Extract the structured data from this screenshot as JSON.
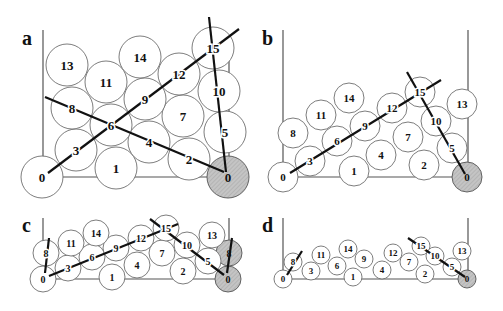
{
  "figure": {
    "hatch_color": "#c4c4c4",
    "panels": [
      {
        "id": "a",
        "label": "a",
        "label_pos": [
          22,
          45
        ],
        "radius": 21,
        "font_size": 13,
        "walls": {
          "left_x": 43,
          "right_x": 229,
          "top_left": 30,
          "top_right": 35,
          "bottom_y": 177
        },
        "balls": [
          {
            "n": "0",
            "x": 42,
            "y": 177
          },
          {
            "n": "1",
            "x": 116,
            "y": 168
          },
          {
            "n": "2",
            "x": 189,
            "y": 159
          },
          {
            "n": "0",
            "x": 228,
            "y": 177,
            "fixed": true
          },
          {
            "n": "3",
            "x": 76,
            "y": 150
          },
          {
            "n": "4",
            "x": 149,
            "y": 142
          },
          {
            "n": "5",
            "x": 225,
            "y": 132
          },
          {
            "n": "6",
            "x": 111,
            "y": 125
          },
          {
            "n": "7",
            "x": 183,
            "y": 116
          },
          {
            "n": "8",
            "x": 72,
            "y": 108
          },
          {
            "n": "9",
            "x": 145,
            "y": 99
          },
          {
            "n": "10",
            "x": 219,
            "y": 91
          },
          {
            "n": "11",
            "x": 106,
            "y": 82
          },
          {
            "n": "12",
            "x": 179,
            "y": 74
          },
          {
            "n": "13",
            "x": 67,
            "y": 65
          },
          {
            "n": "14",
            "x": 140,
            "y": 57
          },
          {
            "n": "15",
            "x": 213,
            "y": 48
          }
        ],
        "chains": [
          [
            [
              48,
              173
            ],
            [
              239,
              29
            ]
          ],
          [
            [
              45,
              97
            ],
            [
              224,
              172
            ]
          ],
          [
            [
              209,
              17
            ],
            [
              226,
              172
            ]
          ]
        ]
      },
      {
        "id": "b",
        "label": "b",
        "label_pos": [
          262,
          45
        ],
        "radius": 15,
        "font_size": 11,
        "walls": {
          "left_x": 283,
          "right_x": 468,
          "top_left": 30,
          "top_right": 30,
          "bottom_y": 177
        },
        "balls": [
          {
            "n": "0",
            "x": 283,
            "y": 177
          },
          {
            "n": "1",
            "x": 354,
            "y": 171
          },
          {
            "n": "2",
            "x": 424,
            "y": 165
          },
          {
            "n": "0",
            "x": 467,
            "y": 177,
            "fixed": true
          },
          {
            "n": "3",
            "x": 310,
            "y": 161
          },
          {
            "n": "4",
            "x": 381,
            "y": 155
          },
          {
            "n": "5",
            "x": 452,
            "y": 148
          },
          {
            "n": "6",
            "x": 337,
            "y": 141
          },
          {
            "n": "7",
            "x": 408,
            "y": 137
          },
          {
            "n": "8",
            "x": 293,
            "y": 133
          },
          {
            "n": "9",
            "x": 365,
            "y": 126
          },
          {
            "n": "10",
            "x": 436,
            "y": 121
          },
          {
            "n": "11",
            "x": 321,
            "y": 115
          },
          {
            "n": "12",
            "x": 392,
            "y": 108
          },
          {
            "n": "13",
            "x": 462,
            "y": 104
          },
          {
            "n": "14",
            "x": 349,
            "y": 98
          },
          {
            "n": "15",
            "x": 420,
            "y": 92
          }
        ],
        "chains": [
          [
            [
              290,
              173
            ],
            [
              441,
              80
            ]
          ],
          [
            [
              407,
              72
            ],
            [
              465,
              174
            ]
          ]
        ]
      },
      {
        "id": "c",
        "label": "c",
        "label_pos": [
          22,
          232
        ],
        "radius": 13,
        "font_size": 10,
        "walls": {
          "left_x": 43,
          "right_x": 229,
          "top_left": 218,
          "top_right": 218,
          "bottom_y": 279
        },
        "balls": [
          {
            "n": "0",
            "x": 43,
            "y": 279
          },
          {
            "n": "1",
            "x": 112,
            "y": 277
          },
          {
            "n": "2",
            "x": 183,
            "y": 271
          },
          {
            "n": "0",
            "x": 228,
            "y": 279,
            "fixed": true
          },
          {
            "n": "8",
            "x": 229,
            "y": 253,
            "fixed": true
          },
          {
            "n": "3",
            "x": 68,
            "y": 268
          },
          {
            "n": "4",
            "x": 137,
            "y": 265
          },
          {
            "n": "5",
            "x": 208,
            "y": 261
          },
          {
            "n": "6",
            "x": 92,
            "y": 257
          },
          {
            "n": "7",
            "x": 162,
            "y": 253
          },
          {
            "n": "8",
            "x": 46,
            "y": 253
          },
          {
            "n": "9",
            "x": 116,
            "y": 248
          },
          {
            "n": "10",
            "x": 187,
            "y": 245
          },
          {
            "n": "11",
            "x": 71,
            "y": 243
          },
          {
            "n": "12",
            "x": 141,
            "y": 238
          },
          {
            "n": "13",
            "x": 212,
            "y": 235
          },
          {
            "n": "14",
            "x": 96,
            "y": 233
          },
          {
            "n": "15",
            "x": 166,
            "y": 228
          }
        ],
        "chains": [
          [
            [
              49,
              276
            ],
            [
              178,
              224
            ]
          ],
          [
            [
              45,
              273
            ],
            [
              49,
              238
            ]
          ],
          [
            [
              150,
              219
            ],
            [
              224,
              275
            ]
          ],
          [
            [
              227,
              273
            ],
            [
              232,
              238
            ]
          ]
        ]
      },
      {
        "id": "d",
        "label": "d",
        "label_pos": [
          262,
          232
        ],
        "radius": 9,
        "font_size": 9,
        "walls": {
          "left_x": 283,
          "right_x": 468,
          "top_left": 218,
          "top_right": 218,
          "bottom_y": 279
        },
        "balls": [
          {
            "n": "0",
            "x": 283,
            "y": 279
          },
          {
            "n": "8",
            "x": 293,
            "y": 262
          },
          {
            "n": "3",
            "x": 311,
            "y": 271
          },
          {
            "n": "11",
            "x": 321,
            "y": 255
          },
          {
            "n": "6",
            "x": 337,
            "y": 266
          },
          {
            "n": "14",
            "x": 348,
            "y": 249
          },
          {
            "n": "1",
            "x": 353,
            "y": 277
          },
          {
            "n": "9",
            "x": 364,
            "y": 259
          },
          {
            "n": "4",
            "x": 382,
            "y": 270
          },
          {
            "n": "12",
            "x": 393,
            "y": 253
          },
          {
            "n": "7",
            "x": 409,
            "y": 262
          },
          {
            "n": "15",
            "x": 421,
            "y": 246
          },
          {
            "n": "2",
            "x": 425,
            "y": 274
          },
          {
            "n": "10",
            "x": 435,
            "y": 256
          },
          {
            "n": "5",
            "x": 452,
            "y": 267
          },
          {
            "n": "13",
            "x": 462,
            "y": 251
          },
          {
            "n": "0",
            "x": 467,
            "y": 279,
            "fixed": true
          }
        ],
        "chains": [
          [
            [
              287,
              275
            ],
            [
              302,
              251
            ]
          ],
          [
            [
              408,
              238
            ],
            [
              465,
              277
            ]
          ]
        ]
      }
    ]
  }
}
